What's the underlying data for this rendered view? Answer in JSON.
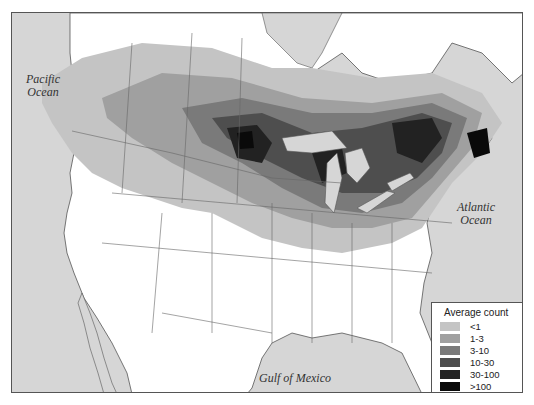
{
  "map": {
    "ocean_labels": [
      {
        "id": "pacific",
        "line1": "Pacific",
        "line2": "Ocean"
      },
      {
        "id": "atlantic",
        "line1": "Atlantic",
        "line2": "Ocean"
      },
      {
        "id": "gulf",
        "line1": "Gulf of Mexico",
        "line2": ""
      }
    ],
    "colors": {
      "ocean": "#d6d6d6",
      "land": "#ffffff",
      "border": "#666666"
    }
  },
  "legend": {
    "title": "Average count",
    "items": [
      {
        "label": "<1",
        "color": "#c4c4c4"
      },
      {
        "label": "1-3",
        "color": "#a0a0a0"
      },
      {
        "label": "3-10",
        "color": "#7a7a7a"
      },
      {
        "label": "10-30",
        "color": "#4e4e4e"
      },
      {
        "label": "30-100",
        "color": "#222222"
      },
      {
        "label": ">100",
        "color": "#0a0a0a"
      }
    ]
  }
}
